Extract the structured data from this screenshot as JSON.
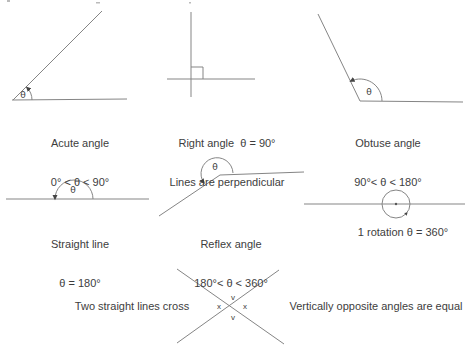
{
  "colors": {
    "stroke": "#858585",
    "text": "#3d3d3d",
    "arrow": "#444444"
  },
  "figures": {
    "acute": {
      "name": "Acute angle",
      "range": "0° < θ < 90°",
      "theta": "θ"
    },
    "right": {
      "name": "Right angle  θ = 90°",
      "note": "Lines are perpendicular"
    },
    "obtuse": {
      "name": "Obtuse angle",
      "range": "90°< θ < 180°",
      "theta": "θ"
    },
    "straight": {
      "name": "Straight line",
      "range": "θ = 180°",
      "theta": "θ"
    },
    "reflex": {
      "name": "Reflex angle",
      "range": "180°< θ < 360°",
      "theta": "θ"
    },
    "rotation": {
      "caption": "1 rotation θ = 360°"
    },
    "cross": {
      "left_caption": "Two straight lines cross",
      "right_caption": "Vertically opposite angles are equal",
      "angle_labels": {
        "top": "v",
        "left": "x",
        "right": "x",
        "bottom": "v"
      }
    }
  }
}
